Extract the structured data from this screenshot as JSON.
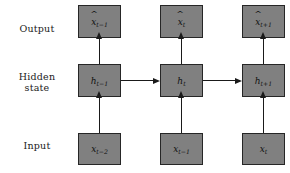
{
  "figure": {
    "background_color": "#ffffff",
    "node_fill_color": "#808080",
    "node_border_color": "#262626",
    "arrow_color": "#1a1a1a"
  },
  "row_labels": {
    "output": "Output",
    "hidden": "Hidden\nstate",
    "input": "Input"
  },
  "rows": [
    {
      "id": "output",
      "label": "Output",
      "nodes": [
        {
          "id": "output-0",
          "symbol": "x",
          "hat": true,
          "subscript": "t−1"
        },
        {
          "id": "output-1",
          "symbol": "x",
          "hat": true,
          "subscript": "t"
        },
        {
          "id": "output-2",
          "symbol": "x",
          "hat": true,
          "subscript": "t+1"
        }
      ]
    },
    {
      "id": "hidden",
      "label": "Hidden state",
      "nodes": [
        {
          "id": "hidden-0",
          "symbol": "h",
          "hat": false,
          "subscript": "t−1"
        },
        {
          "id": "hidden-1",
          "symbol": "h",
          "hat": false,
          "subscript": "t"
        },
        {
          "id": "hidden-2",
          "symbol": "h",
          "hat": false,
          "subscript": "t+1"
        }
      ]
    },
    {
      "id": "input",
      "label": "Input",
      "nodes": [
        {
          "id": "input-0",
          "symbol": "x",
          "hat": false,
          "subscript": "t−2"
        },
        {
          "id": "input-1",
          "symbol": "x",
          "hat": false,
          "subscript": "t−1"
        },
        {
          "id": "input-2",
          "symbol": "x",
          "hat": false,
          "subscript": "t"
        }
      ]
    }
  ],
  "arrows": {
    "input_to_hidden": [
      "input-0 → hidden-0",
      "input-1 → hidden-1",
      "input-2 → hidden-2"
    ],
    "hidden_to_output": [
      "hidden-0 → output-0",
      "hidden-1 → output-1",
      "hidden-2 → output-2"
    ],
    "hidden_to_hidden": [
      "hidden-0 → hidden-1",
      "hidden-1 → hidden-2"
    ]
  },
  "caption_fragment": ""
}
